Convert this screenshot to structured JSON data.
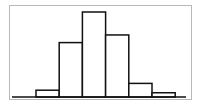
{
  "chart_data": {
    "type": "bar",
    "title": "",
    "xlabel": "",
    "ylabel": "",
    "categories": [
      "1",
      "2",
      "3",
      "4",
      "5",
      "6"
    ],
    "values": [
      8,
      64,
      100,
      73,
      16,
      5
    ],
    "ylim": [
      0,
      100
    ],
    "grid": false,
    "legend": null,
    "style": {
      "bar_fill": "#ffffff",
      "bar_stroke": "#111111",
      "frame_color": "#b8b8b8"
    }
  }
}
